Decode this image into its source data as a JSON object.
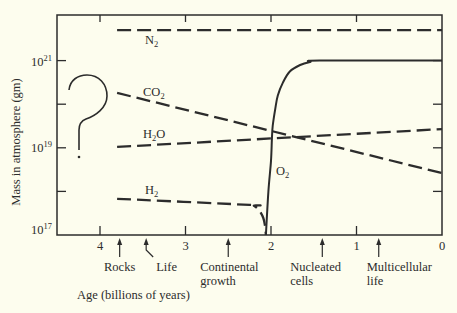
{
  "chart_data": {
    "type": "line",
    "title": "",
    "xlabel": "Age (billions of years)",
    "ylabel": "Mass in atmosphere (gm)",
    "x_scale": "linear, reversed (age decreases to the right)",
    "y_scale": "log10",
    "xlim": [
      4.5,
      0
    ],
    "ylim_log10": [
      17,
      22
    ],
    "grid": false,
    "legend": "inline labels next to each curve",
    "x_ticks": [
      4,
      3,
      2,
      1,
      0
    ],
    "x_tick_labels": [
      "4",
      "3",
      "2",
      "1",
      "0"
    ],
    "y_ticks_log10": [
      17,
      18,
      19,
      20,
      21
    ],
    "y_tick_labels": [
      {
        "base": "10",
        "exp": "21",
        "log10": 21
      },
      {
        "base": "10",
        "exp": "19",
        "log10": 19
      },
      {
        "base": "10",
        "exp": "17",
        "log10": 17
      }
    ],
    "series": [
      {
        "name": "N2",
        "label": {
          "base": "N",
          "sub": "2",
          "tail": ""
        },
        "style": "dashed",
        "points_age_log10mass": [
          [
            3.8,
            21.7
          ],
          [
            0,
            21.7
          ]
        ]
      },
      {
        "name": "CO2",
        "label": {
          "base": "CO",
          "sub": "2",
          "tail": ""
        },
        "style": "dashed",
        "points_age_log10mass": [
          [
            3.8,
            20.26
          ],
          [
            0,
            18.42
          ]
        ]
      },
      {
        "name": "H2O",
        "label": {
          "base": "H",
          "sub": "2",
          "tail": "O"
        },
        "style": "dashed",
        "points_age_log10mass": [
          [
            3.8,
            19.02
          ],
          [
            0,
            19.43
          ]
        ]
      },
      {
        "name": "H2",
        "label": {
          "base": "H",
          "sub": "2",
          "tail": ""
        },
        "style": "dashed",
        "points_age_log10mass": [
          [
            3.8,
            17.83
          ],
          [
            2.25,
            17.69
          ],
          [
            2.2,
            17.67
          ],
          [
            2.14,
            17.57
          ],
          [
            2.09,
            17.39
          ],
          [
            2.07,
            17.21
          ],
          [
            2.06,
            17.0
          ]
        ]
      },
      {
        "name": "O2",
        "label": {
          "base": "O",
          "sub": "2",
          "tail": ""
        },
        "style": "solid",
        "points_age_log10mass": [
          [
            2.06,
            17.0
          ],
          [
            2.03,
            18.0
          ],
          [
            2.0,
            18.7
          ],
          [
            1.99,
            19.2
          ],
          [
            1.98,
            19.5
          ],
          [
            1.95,
            19.9
          ],
          [
            1.92,
            20.2
          ],
          [
            1.86,
            20.5
          ],
          [
            1.78,
            20.75
          ],
          [
            1.66,
            20.9
          ],
          [
            1.54,
            20.97
          ],
          [
            1.43,
            21.0
          ],
          [
            0,
            21.0
          ]
        ]
      }
    ],
    "events": [
      {
        "label_lines": [
          "Rocks"
        ],
        "age": 3.77
      },
      {
        "label_lines": [
          "Life"
        ],
        "age": 3.46
      },
      {
        "label_lines": [
          "Continental",
          "growth"
        ],
        "age": 2.5
      },
      {
        "label_lines": [
          "Nucleated",
          "cells"
        ],
        "age": 1.4
      },
      {
        "label_lines": [
          "Multicellular",
          "life"
        ],
        "age": 0.74
      }
    ],
    "annotations": [
      {
        "text": "?",
        "position": "left of curves, ages ~4.4–4.0, between 10^21 and 10^19"
      }
    ]
  },
  "colors": {
    "background": "#fdfdee",
    "ink": "#2c2c2c"
  }
}
